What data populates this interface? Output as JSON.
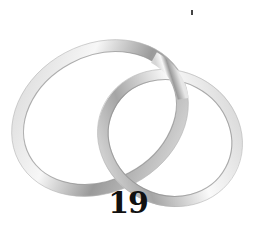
{
  "image": {
    "subject": "two interlocking silver wedding rings",
    "number_label": "19",
    "colors": {
      "background": "#ffffff",
      "ring_light": "#f4f4f4",
      "ring_mid": "#c8c8c8",
      "ring_dark": "#8a8a8a",
      "text": "#111111"
    }
  }
}
